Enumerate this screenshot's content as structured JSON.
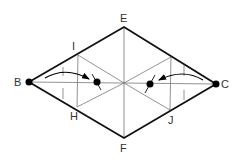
{
  "diagram": {
    "colors": {
      "outline": "#111111",
      "thin": "#666666",
      "label": "#333333",
      "dot": "#000000"
    },
    "vertices": {
      "B": {
        "label": "B",
        "x": 29,
        "y": 82
      },
      "C": {
        "label": "C",
        "x": 216,
        "y": 84
      },
      "E": {
        "label": "E",
        "x": 124,
        "y": 27
      },
      "F": {
        "label": "F",
        "x": 124,
        "y": 138
      }
    },
    "points": {
      "I": {
        "label": "I",
        "x": 78,
        "y": 55
      },
      "H": {
        "label": "H",
        "x": 77,
        "y": 107
      },
      "J": {
        "label": "J",
        "x": 170,
        "y": 110
      },
      "K": {
        "label": "",
        "x": 171,
        "y": 57
      },
      "O": {
        "label": "",
        "x": 124,
        "y": 83
      }
    },
    "labels": {
      "B": "B",
      "C": "C",
      "E": "E",
      "F": "F",
      "I": "I",
      "H": "H",
      "J": "J"
    },
    "dots": [
      {
        "name": "B",
        "x": 29,
        "y": 82
      },
      {
        "name": "C",
        "x": 216,
        "y": 84
      },
      {
        "name": "left-inner",
        "x": 97,
        "y": 82
      },
      {
        "name": "right-inner",
        "x": 150,
        "y": 84
      }
    ],
    "arrows": [
      {
        "name": "left-fold-arrow",
        "from": [
          45,
          78
        ],
        "to": [
          89,
          79
        ],
        "direction": "right"
      },
      {
        "name": "right-fold-arrow",
        "from": [
          203,
          80
        ],
        "to": [
          159,
          80
        ],
        "direction": "left"
      }
    ]
  }
}
